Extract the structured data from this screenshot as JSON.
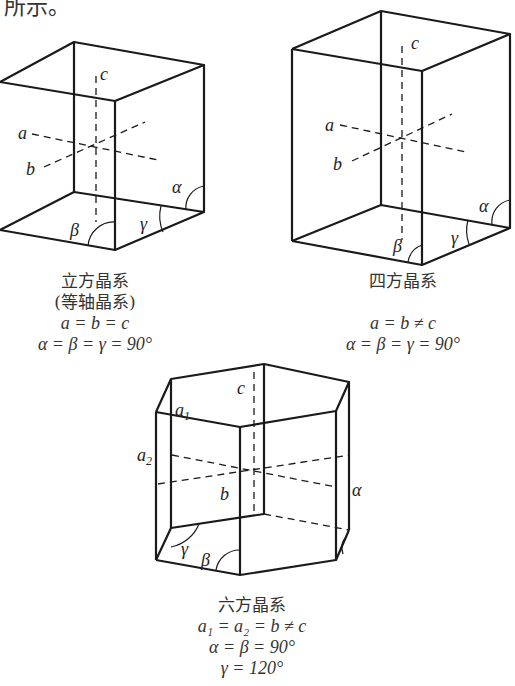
{
  "top_fragment": "所示。",
  "figures": [
    {
      "id": "cubic",
      "labels": {
        "a": "a",
        "b": "b",
        "c": "c",
        "alpha": "α",
        "beta": "β",
        "gamma": "γ"
      },
      "caption": {
        "name": "立方晶系",
        "alt_name": "(等轴晶系)",
        "axes": "a = b = c",
        "angles": "α = β = γ = 90°"
      }
    },
    {
      "id": "tetragonal",
      "labels": {
        "a": "a",
        "b": "b",
        "c": "c",
        "alpha": "α",
        "beta": "β",
        "gamma": "γ"
      },
      "caption": {
        "name": "四方晶系",
        "axes": "a = b ≠ c",
        "angles": "α = β = γ = 90°"
      }
    },
    {
      "id": "hexagonal",
      "labels": {
        "a1": "a",
        "a1_sub": "1",
        "a2": "a",
        "a2_sub": "2",
        "b": "b",
        "c": "c",
        "alpha": "α",
        "beta": "β",
        "gamma": "γ"
      },
      "caption": {
        "name": "六方晶系",
        "axes": "a₁ = a₂ = b ≠ c",
        "angles1": "α = β = 90°",
        "angles2": "γ = 120°"
      }
    }
  ]
}
